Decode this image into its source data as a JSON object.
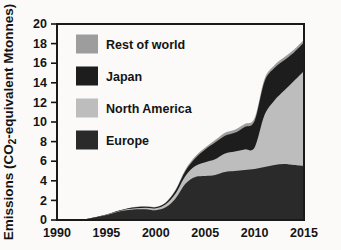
{
  "figure": {
    "background": "#fbfaf8",
    "plot_background": "#fdfdfc",
    "frame_color": "#1a1a1a"
  },
  "chart_data": {
    "type": "area",
    "stacked": true,
    "title": "",
    "xlabel": "",
    "ylabel": "Emissions (CO2-equivalent Mtonnes)",
    "ylabel_parts": [
      {
        "text": "Emissions (CO"
      },
      {
        "text": "2",
        "sub": true
      },
      {
        "text": "-equivalent Mtonnes)"
      }
    ],
    "xlim": [
      1990,
      2015
    ],
    "ylim": [
      0,
      20
    ],
    "xticks": [
      1990,
      1995,
      2000,
      2005,
      2010,
      2015
    ],
    "yticks": [
      0,
      2,
      4,
      6,
      8,
      10,
      12,
      14,
      16,
      18,
      20
    ],
    "grid": false,
    "legend_position": "top-left",
    "legend_order": [
      "Rest of world",
      "Japan",
      "North America",
      "Europe"
    ],
    "axis_color": "#141414",
    "x": [
      1990,
      1991,
      1992,
      1993,
      1994,
      1995,
      1996,
      1997,
      1998,
      1999,
      2000,
      2001,
      2002,
      2003,
      2004,
      2005,
      2006,
      2007,
      2008,
      2009,
      2010,
      2011,
      2012,
      2013,
      2014,
      2015
    ],
    "series": [
      {
        "name": "Europe",
        "color": "#2a2a2a",
        "values": [
          0,
          0,
          0.05,
          0.1,
          0.3,
          0.5,
          0.8,
          1.0,
          1.1,
          1.1,
          1.0,
          1.3,
          2.2,
          3.7,
          4.4,
          4.5,
          4.6,
          4.9,
          5.0,
          5.1,
          5.2,
          5.4,
          5.6,
          5.7,
          5.6,
          5.5
        ]
      },
      {
        "name": "North America",
        "color": "#bdbdbd",
        "values": [
          0,
          0,
          0,
          0,
          0,
          0.05,
          0.05,
          0.1,
          0.1,
          0.15,
          0.2,
          0.3,
          0.5,
          0.8,
          1.1,
          1.4,
          1.6,
          1.9,
          2.0,
          2.1,
          2.2,
          5.3,
          6.6,
          7.5,
          8.6,
          9.7
        ]
      },
      {
        "name": "Japan",
        "color": "#1d1d1d",
        "values": [
          0,
          0,
          0,
          0,
          0,
          0,
          0.05,
          0.05,
          0.1,
          0.1,
          0.1,
          0.15,
          0.3,
          0.5,
          0.8,
          1.3,
          1.7,
          1.8,
          1.9,
          2.3,
          2.7,
          3.4,
          3.3,
          3.1,
          2.9,
          2.9
        ]
      },
      {
        "name": "Rest of world",
        "color": "#9d9d9d",
        "values": [
          0,
          0,
          0,
          0,
          0,
          0,
          0,
          0,
          0.05,
          0.05,
          0.05,
          0.05,
          0.1,
          0.15,
          0.2,
          0.2,
          0.25,
          0.3,
          0.3,
          0.3,
          0.3,
          0.3,
          0.3,
          0.3,
          0.3,
          0.3
        ]
      }
    ]
  }
}
